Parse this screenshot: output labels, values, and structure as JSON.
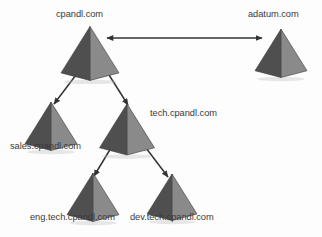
{
  "diagram": {
    "background_color": "#fdfdfd",
    "label_color": "#3a3a3a",
    "pyramid_colors": {
      "left_face": "#4f4f4f",
      "right_face": "#8a8a8a",
      "left_face_shade": "#474747",
      "outline": "#3a3a3a",
      "shadow": "#b9b9b9"
    },
    "arrow_color": "#333333",
    "nodes": [
      {
        "id": "cpandl",
        "label": "cpandl.com",
        "icon": "pyramid-icon",
        "x": 90,
        "y": 52,
        "size": 58,
        "label_x": 56,
        "label_y": 9
      },
      {
        "id": "adatum",
        "label": "adatum.com",
        "icon": "pyramid-icon",
        "x": 281,
        "y": 52,
        "size": 52,
        "label_x": 248,
        "label_y": 9
      },
      {
        "id": "sales",
        "label": "sales.cpandl.com",
        "icon": "pyramid-icon",
        "x": 51,
        "y": 125,
        "size": 52,
        "label_x": 10,
        "label_y": 141
      },
      {
        "id": "tech",
        "label": "tech.cpandl.com",
        "icon": "pyramid-icon",
        "x": 127,
        "y": 128,
        "size": 55,
        "label_x": 150,
        "label_y": 108
      },
      {
        "id": "eng",
        "label": "eng.tech.cpandl.com",
        "icon": "pyramid-icon",
        "x": 93,
        "y": 196,
        "size": 52,
        "label_x": 30,
        "label_y": 212
      },
      {
        "id": "dev",
        "label": "dev.tech.cpandl.com",
        "icon": "pyramid-icon",
        "x": 172,
        "y": 196,
        "size": 50,
        "label_x": 130,
        "label_y": 212
      }
    ],
    "connections": [
      {
        "id": "trust-cpandl-adatum",
        "from": "cpandl",
        "to": "adatum",
        "type": "bidirectional",
        "x1": 107,
        "y1": 38,
        "x2": 262,
        "y2": 38
      },
      {
        "id": "trust-cpandl-sales",
        "from": "cpandl",
        "to": "sales",
        "type": "bidirectional",
        "x1": 82,
        "y1": 67,
        "x2": 54,
        "y2": 104
      },
      {
        "id": "trust-cpandl-tech",
        "from": "cpandl",
        "to": "tech",
        "type": "bidirectional",
        "x1": 104,
        "y1": 67,
        "x2": 128,
        "y2": 105
      },
      {
        "id": "trust-tech-eng",
        "from": "tech",
        "to": "eng",
        "type": "bidirectional",
        "x1": 114,
        "y1": 143,
        "x2": 94,
        "y2": 176
      },
      {
        "id": "trust-tech-dev",
        "from": "tech",
        "to": "dev",
        "type": "bidirectional",
        "x1": 143,
        "y1": 144,
        "x2": 168,
        "y2": 177
      }
    ]
  }
}
